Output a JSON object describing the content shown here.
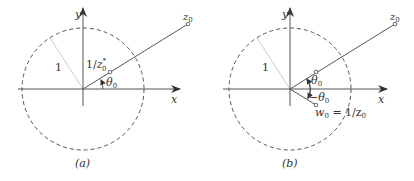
{
  "panels": [
    {
      "id": "a",
      "caption": "(a)",
      "axis_x_label": "x",
      "axis_y_label": "y",
      "radius_label": "1",
      "point_z0_label": "z",
      "point_z0_sub": "0",
      "inverse_label_prefix": "1/z",
      "inverse_label_sup": "*",
      "inverse_label_sub": "0",
      "angle_label": "θ",
      "angle_sub": "0"
    },
    {
      "id": "b",
      "caption": "(b)",
      "axis_x_label": "x",
      "axis_y_label": "y",
      "radius_label": "1",
      "point_z0_label": "z",
      "point_z0_sub": "0",
      "angle_label": "θ",
      "angle_sub": "0",
      "neg_angle_label": "−θ",
      "neg_angle_sub": "0",
      "w0_label": "w",
      "w0_sub": "0",
      "w0_eq": " = 1/z",
      "w0_eq_sub": "0"
    }
  ],
  "colors": {
    "line": "#555555",
    "circle": "#555555",
    "radius": "#cccccc",
    "text": "#333333"
  }
}
